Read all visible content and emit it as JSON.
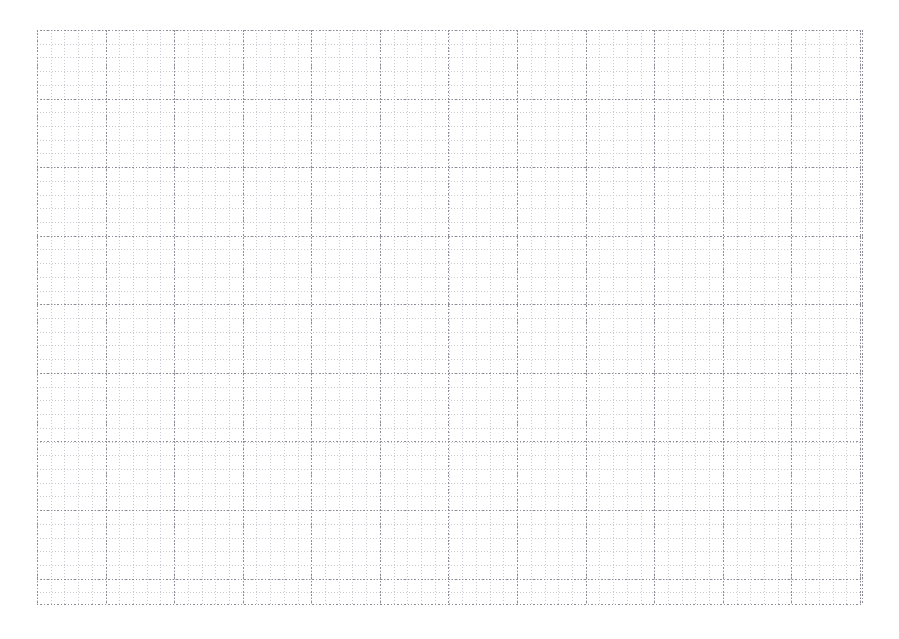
{
  "page": {
    "kind": "grid-paper-sheet",
    "background_color": "#ffffff",
    "width": 899,
    "height": 639
  },
  "grid": {
    "origin_x": 37,
    "origin_y": 30,
    "width": 826,
    "height": 575,
    "minor": {
      "spacing_px": 13.7167,
      "color": "#c9c9cf",
      "style": "dotted",
      "columns": 60,
      "rows": 42
    },
    "major": {
      "spacing_px": 68.5833,
      "color": "#8e8e99",
      "style": "dotted",
      "minor_cells_per_major": 5,
      "columns": 12,
      "rows": 8
    }
  },
  "chart_data": {
    "type": "table",
    "title": "",
    "xlabel": "",
    "ylabel": "",
    "categories": [],
    "values": [],
    "annotations": [],
    "legend": [],
    "grid": true,
    "note": "Blank dotted grid paper. No data series, labels, ticks, or text are rendered in the image."
  }
}
